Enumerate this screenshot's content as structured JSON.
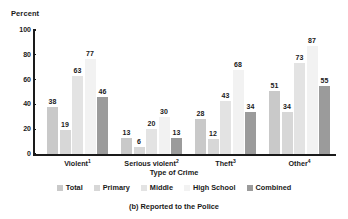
{
  "chart_data": {
    "type": "bar",
    "title": "",
    "caption": "(b) Reported to the Police",
    "ylabel": "Percent",
    "xlabel": "Type of Crime",
    "ylim": [
      0,
      100
    ],
    "yticks": [
      0,
      20,
      40,
      60,
      80,
      100
    ],
    "grid": false,
    "legend_position": "bottom",
    "categories": [
      "Violent",
      "Serious violent",
      "Theft",
      "Other"
    ],
    "category_labels": [
      "Violent1",
      "Serious violent2",
      "Theft3",
      "Other4"
    ],
    "category_footnotes": [
      "1",
      "2",
      "3",
      "4"
    ],
    "series": [
      {
        "name": "Total",
        "color": "#c9c9c9",
        "values": [
          38,
          13,
          28,
          51
        ]
      },
      {
        "name": "Primary",
        "color": "#d7d7d7",
        "values": [
          19,
          6,
          12,
          34
        ]
      },
      {
        "name": "Middle",
        "color": "#e3e3e3",
        "values": [
          63,
          20,
          43,
          73
        ]
      },
      {
        "name": "High School",
        "color": "#f2f2f2",
        "values": [
          77,
          30,
          68,
          87
        ]
      },
      {
        "name": "Combined",
        "color": "#9b9b9b",
        "values": [
          46,
          13,
          34,
          55
        ]
      }
    ]
  },
  "axis": {
    "y_title": "Percent",
    "x_title": "Type of Crime",
    "tick_labels": [
      "100",
      "80",
      "60",
      "40",
      "20",
      "0"
    ]
  },
  "legend": {
    "items": [
      {
        "label": "Total"
      },
      {
        "label": "Primary"
      },
      {
        "label": "Middle"
      },
      {
        "label": "High School"
      },
      {
        "label": "Combined"
      }
    ]
  },
  "caption": {
    "text": "(b) Reported to the Police"
  }
}
